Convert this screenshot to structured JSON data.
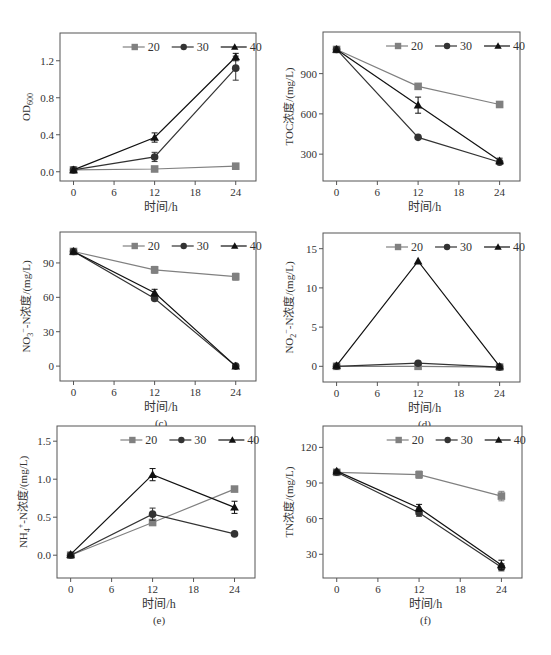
{
  "figure": {
    "legend_labels": [
      "20",
      "30",
      "40"
    ],
    "x_label": "时间/h"
  },
  "chart_data": [
    {
      "id": "a",
      "type": "line",
      "caption": "(a)",
      "title": "",
      "xlabel": "时间/h",
      "ylabel": "OD600",
      "ylabel_main": "OD",
      "ylabel_sub": "600",
      "x": [
        0,
        12,
        24
      ],
      "xticks": [
        0,
        6,
        12,
        18,
        24
      ],
      "xlim": [
        -2,
        27
      ],
      "yticks": [
        0.0,
        0.4,
        0.8,
        1.2
      ],
      "ytick_labels": [
        "0.0",
        "0.4",
        "0.8",
        "1.2"
      ],
      "ylim": [
        -0.1,
        1.5
      ],
      "legend_position": "top-center",
      "grid": false,
      "series": [
        {
          "name": "20",
          "marker": "square",
          "color": "#808080",
          "values": [
            0.02,
            0.03,
            0.06
          ],
          "errors": [
            0.01,
            0.02,
            0.01
          ]
        },
        {
          "name": "30",
          "marker": "circle",
          "color": "#333333",
          "values": [
            0.02,
            0.16,
            1.12
          ],
          "errors": [
            0.01,
            0.05,
            0.13
          ]
        },
        {
          "name": "40",
          "marker": "triangle",
          "color": "#111111",
          "values": [
            0.02,
            0.37,
            1.24
          ],
          "errors": [
            0.01,
            0.05,
            0.04
          ]
        }
      ]
    },
    {
      "id": "b",
      "type": "line",
      "caption": "(b)",
      "title": "",
      "xlabel": "时间/h",
      "ylabel": "TOC浓度/(mg/L)",
      "x": [
        0,
        12,
        24
      ],
      "xticks": [
        0,
        6,
        12,
        18,
        24
      ],
      "xlim": [
        -2,
        27
      ],
      "yticks": [
        300,
        600,
        900
      ],
      "ytick_labels": [
        "300",
        "600",
        "900"
      ],
      "ylim": [
        100,
        1210
      ],
      "legend_position": "top-center",
      "grid": false,
      "series": [
        {
          "name": "20",
          "marker": "square",
          "color": "#808080",
          "values": [
            1080,
            805,
            670
          ],
          "errors": [
            10,
            15,
            10
          ]
        },
        {
          "name": "30",
          "marker": "circle",
          "color": "#333333",
          "values": [
            1080,
            425,
            240
          ],
          "errors": [
            10,
            10,
            10
          ]
        },
        {
          "name": "40",
          "marker": "triangle",
          "color": "#111111",
          "values": [
            1080,
            665,
            250
          ],
          "errors": [
            10,
            60,
            20
          ]
        }
      ]
    },
    {
      "id": "c",
      "type": "line",
      "caption": "(c)",
      "title": "",
      "xlabel": "时间/h",
      "ylabel": "NO3−-N浓度/(mg/L)",
      "ylabel_main": "NO",
      "ylabel_sub": "3",
      "ylabel_sup": "−",
      "ylabel_rest": "-N浓度/(mg/L)",
      "x": [
        0,
        12,
        24
      ],
      "xticks": [
        0,
        6,
        12,
        18,
        24
      ],
      "xlim": [
        -2,
        27
      ],
      "yticks": [
        0,
        30,
        60,
        90
      ],
      "ytick_labels": [
        "0",
        "30",
        "60",
        "90"
      ],
      "ylim": [
        -13,
        117
      ],
      "legend_position": "top-center",
      "grid": false,
      "series": [
        {
          "name": "20",
          "marker": "square",
          "color": "#808080",
          "values": [
            100,
            84,
            78
          ],
          "errors": [
            1,
            3,
            3
          ]
        },
        {
          "name": "30",
          "marker": "circle",
          "color": "#333333",
          "values": [
            100,
            59,
            0
          ],
          "errors": [
            1,
            2,
            1
          ]
        },
        {
          "name": "40",
          "marker": "triangle",
          "color": "#111111",
          "values": [
            100,
            64,
            0
          ],
          "errors": [
            1,
            3,
            2
          ]
        }
      ]
    },
    {
      "id": "d",
      "type": "line",
      "caption": "(d)",
      "title": "",
      "xlabel": "时间/h",
      "ylabel": "NO2−-N浓度/(mg/L)",
      "ylabel_main": "NO",
      "ylabel_sub": "2",
      "ylabel_sup": "−",
      "ylabel_rest": "-N浓度/(mg/L)",
      "x": [
        0,
        12,
        24
      ],
      "xticks": [
        0,
        6,
        12,
        18,
        24
      ],
      "xlim": [
        -2,
        27
      ],
      "yticks": [
        0,
        5,
        10,
        15
      ],
      "ytick_labels": [
        "0",
        "5",
        "10",
        "15"
      ],
      "ylim": [
        -2,
        17
      ],
      "legend_position": "top-center",
      "grid": false,
      "series": [
        {
          "name": "20",
          "marker": "square",
          "color": "#808080",
          "values": [
            0,
            0.0,
            -0.1
          ],
          "errors": [
            0.1,
            0.2,
            0.1
          ]
        },
        {
          "name": "30",
          "marker": "circle",
          "color": "#333333",
          "values": [
            0,
            0.4,
            -0.1
          ],
          "errors": [
            0.1,
            0.2,
            0.1
          ]
        },
        {
          "name": "40",
          "marker": "triangle",
          "color": "#111111",
          "values": [
            0.1,
            13.4,
            0
          ],
          "errors": [
            0.1,
            0.2,
            0.1
          ]
        }
      ]
    },
    {
      "id": "e",
      "type": "line",
      "caption": "(e)",
      "title": "",
      "xlabel": "时间/h",
      "ylabel": "NH4+-N浓度/(mg/L)",
      "ylabel_main": "NH",
      "ylabel_sub": "4",
      "ylabel_sup": "+",
      "ylabel_rest": "-N浓度/(mg/L)",
      "x": [
        0,
        12,
        24
      ],
      "xticks": [
        0,
        6,
        12,
        18,
        24
      ],
      "xlim": [
        -2,
        27
      ],
      "yticks": [
        0.0,
        0.5,
        1.0,
        1.5
      ],
      "ytick_labels": [
        "0.0",
        "0.5",
        "1.0",
        "1.5"
      ],
      "ylim": [
        -0.3,
        1.7
      ],
      "legend_position": "top-center",
      "grid": false,
      "series": [
        {
          "name": "20",
          "marker": "square",
          "color": "#808080",
          "values": [
            0.0,
            0.43,
            0.87
          ],
          "errors": [
            0.01,
            0.02,
            0.02
          ]
        },
        {
          "name": "30",
          "marker": "circle",
          "color": "#333333",
          "values": [
            0.0,
            0.54,
            0.28
          ],
          "errors": [
            0.01,
            0.08,
            0.01
          ]
        },
        {
          "name": "40",
          "marker": "triangle",
          "color": "#111111",
          "values": [
            0.01,
            1.06,
            0.63
          ],
          "errors": [
            0.01,
            0.08,
            0.08
          ]
        }
      ]
    },
    {
      "id": "f",
      "type": "line",
      "caption": "(f)",
      "title": "",
      "xlabel": "时间/h",
      "ylabel": "TN浓度/(mg/L)",
      "x": [
        0,
        12,
        24
      ],
      "xticks": [
        0,
        6,
        12,
        18,
        24
      ],
      "xlim": [
        -2,
        27
      ],
      "yticks": [
        30,
        60,
        90,
        120
      ],
      "ytick_labels": [
        "30",
        "60",
        "90",
        "120"
      ],
      "ylim": [
        10,
        138
      ],
      "legend_position": "top-center",
      "grid": false,
      "series": [
        {
          "name": "20",
          "marker": "square",
          "color": "#808080",
          "values": [
            99,
            97,
            79
          ],
          "errors": [
            1,
            3,
            4
          ]
        },
        {
          "name": "30",
          "marker": "circle",
          "color": "#333333",
          "values": [
            99,
            65,
            19
          ],
          "errors": [
            1,
            3,
            3
          ]
        },
        {
          "name": "40",
          "marker": "triangle",
          "color": "#111111",
          "values": [
            100,
            69,
            21
          ],
          "errors": [
            1,
            3,
            4
          ]
        }
      ]
    }
  ]
}
